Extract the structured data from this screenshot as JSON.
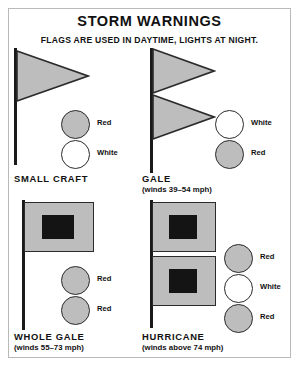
{
  "poster": {
    "title": "STORM WARNINGS",
    "subtitle": "FLAGS ARE USED IN DAYTIME, LIGHTS AT NIGHT."
  },
  "colors": {
    "flag_fill": "#bdbdbd",
    "flag_outline": "#2b2b2b",
    "black_square": "#141414",
    "pole": "#1a1a1a",
    "frame": "#b9b9b9",
    "text": "#111111",
    "white_lamp": "#ffffff"
  },
  "warnings": [
    {
      "id": "small-craft",
      "name": "SMALL CRAFT",
      "winds": "",
      "flag_type": "pennant",
      "flag_count": 1,
      "lights": [
        {
          "color_name": "Red",
          "fill": "gray"
        },
        {
          "color_name": "White",
          "fill": "white"
        }
      ]
    },
    {
      "id": "gale",
      "name": "GALE",
      "winds": "(winds 39–54 mph)",
      "flag_type": "pennant",
      "flag_count": 2,
      "lights": [
        {
          "color_name": "White",
          "fill": "white"
        },
        {
          "color_name": "Red",
          "fill": "gray"
        }
      ]
    },
    {
      "id": "whole-gale",
      "name": "WHOLE GALE",
      "winds": "(winds 55–73 mph)",
      "flag_type": "square",
      "flag_count": 1,
      "lights": [
        {
          "color_name": "Red",
          "fill": "gray"
        },
        {
          "color_name": "Red",
          "fill": "gray"
        }
      ]
    },
    {
      "id": "hurricane",
      "name": "HURRICANE",
      "winds": "(winds above 74 mph)",
      "flag_type": "square",
      "flag_count": 2,
      "lights": [
        {
          "color_name": "Red",
          "fill": "gray"
        },
        {
          "color_name": "White",
          "fill": "white"
        },
        {
          "color_name": "Red",
          "fill": "gray"
        }
      ]
    }
  ]
}
